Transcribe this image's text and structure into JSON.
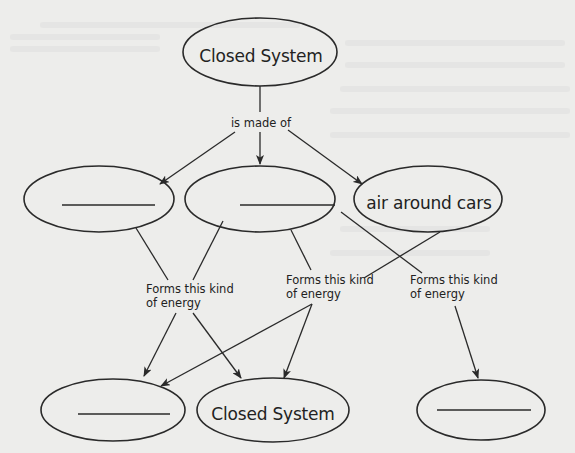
{
  "diagram": {
    "colors": {
      "background": "#ededeb",
      "stroke": "#2a2a2a",
      "text": "#222222"
    },
    "nodes": [
      {
        "id": "top",
        "label": "Closed System",
        "blank": false
      },
      {
        "id": "mid-left",
        "label": "",
        "blank": true
      },
      {
        "id": "mid-center",
        "label": "",
        "blank": true
      },
      {
        "id": "mid-right",
        "label": "air around cars",
        "blank": false
      },
      {
        "id": "bottom-left",
        "label": "",
        "blank": true
      },
      {
        "id": "bottom-center",
        "label": "Closed System",
        "blank": false
      },
      {
        "id": "bottom-right",
        "label": "",
        "blank": true
      }
    ],
    "edge_labels": {
      "made_of": "is made of",
      "forms_1_line1": "Forms this kind",
      "forms_1_line2": "of energy",
      "forms_2_line1": "Forms this kind",
      "forms_2_line2": "of energy",
      "forms_3_line1": "Forms this kind",
      "forms_3_line2": "of energy"
    },
    "edges": [
      {
        "from": "top",
        "to": "mid-left",
        "label": "is made of"
      },
      {
        "from": "top",
        "to": "mid-center",
        "label": "is made of"
      },
      {
        "from": "top",
        "to": "mid-right",
        "label": "is made of"
      },
      {
        "from": "mid-left",
        "to": "bottom-left",
        "label": "Forms this kind of energy"
      },
      {
        "from": "mid-left",
        "to": "bottom-center",
        "label": "Forms this kind of energy"
      },
      {
        "from": "mid-center",
        "to": "bottom-left",
        "label": "Forms this kind of energy"
      },
      {
        "from": "mid-center",
        "to": "bottom-center",
        "label": "Forms this kind of energy"
      },
      {
        "from": "mid-right",
        "to": "bottom-left",
        "label": "Forms this kind of energy"
      },
      {
        "from": "mid-right",
        "to": "bottom-center",
        "label": "Forms this kind of energy"
      },
      {
        "from": "mid-center",
        "to": "bottom-right",
        "label": "Forms this kind of energy"
      }
    ]
  }
}
